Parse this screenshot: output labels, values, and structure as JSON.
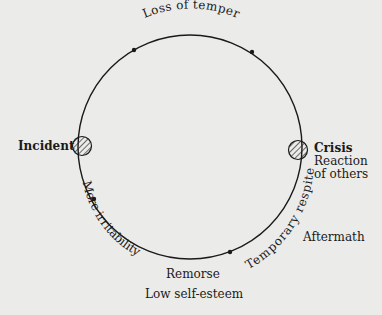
{
  "diagram": {
    "type": "cycle",
    "title": "",
    "nodes": {
      "incident": "Incident",
      "crisis": "Crisis",
      "crisis_sub": [
        "Reaction",
        "of others"
      ],
      "aftermath": "Aftermath",
      "remorse": "Remorse",
      "low_self_esteem": "Low self-esteem"
    },
    "arc_labels": {
      "top": "Loss of temper",
      "right_lower": "Temporary respite",
      "left_lower": "More irritability"
    },
    "colors": {
      "background": "#ebebea",
      "line": "#1a1a1a"
    }
  }
}
